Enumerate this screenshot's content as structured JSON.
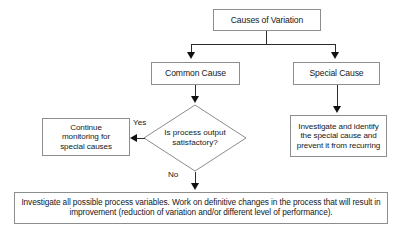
{
  "diagram": {
    "colors": {
      "node_border": "#8d8d8d",
      "node_fill": "#ffffff",
      "edge": "#2b2b2b",
      "arrow": "#111111",
      "text": "#15181c",
      "background": "#ffffff"
    },
    "nodes": [
      {
        "id": "causes",
        "shape": "rectangle",
        "label": "Causes of Variation"
      },
      {
        "id": "common",
        "shape": "rectangle",
        "label": "Common Cause"
      },
      {
        "id": "special",
        "shape": "rectangle",
        "label": "Special Cause"
      },
      {
        "id": "decision",
        "shape": "diamond",
        "label": "Is process output\nsatisfactory?"
      },
      {
        "id": "continue",
        "shape": "rectangle",
        "label": "Continue\nmonitoring for\nspecial causes"
      },
      {
        "id": "investigate_special",
        "shape": "rectangle",
        "label": "Investigate and identify\nthe special cause and\nprevent it from recurring"
      },
      {
        "id": "investigate_all",
        "shape": "rectangle",
        "label": "Investigate all possible process variables. Work on definitive changes in the process that will result in improvement (reduction of variation and/or different level of performance)."
      }
    ],
    "edge_labels": {
      "yes": "Yes",
      "no": "No"
    }
  }
}
